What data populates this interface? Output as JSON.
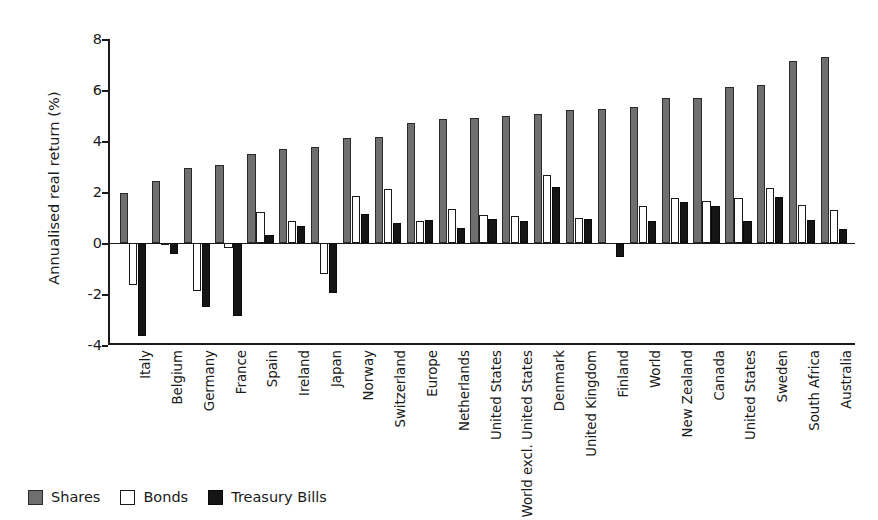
{
  "chart_data": {
    "type": "bar",
    "title": "",
    "xlabel": "",
    "ylabel": "Annualised real return (%)",
    "ylim": [
      -4,
      8
    ],
    "yticks": [
      -4,
      -2,
      0,
      2,
      4,
      6,
      8
    ],
    "ytick_labels": [
      "-4",
      "-2",
      "0",
      "2",
      "4",
      "6",
      "8"
    ],
    "grid": false,
    "legend_position": "bottom-left",
    "categories": [
      "Italy",
      "Belgium",
      "Germany",
      "France",
      "Spain",
      "Ireland",
      "Japan",
      "Norway",
      "Switzerland",
      "Europe",
      "Netherlands",
      "United States",
      "World excl. United States",
      "Denmark",
      "United Kingdom",
      "Finland",
      "World",
      "New Zealand",
      "Canada",
      "United States",
      "Sweden",
      "South Africa",
      "Australia"
    ],
    "series": [
      {
        "name": "Shares",
        "color": "#6f6f6f",
        "values": [
          1.95,
          2.45,
          2.95,
          3.05,
          3.5,
          3.7,
          3.75,
          4.1,
          4.15,
          4.7,
          4.85,
          4.9,
          5.0,
          5.05,
          5.2,
          5.25,
          5.35,
          5.7,
          5.7,
          6.1,
          6.2,
          7.15,
          7.3
        ]
      },
      {
        "name": "Bonds",
        "color": "#ffffff",
        "values": [
          -1.65,
          -0.05,
          -1.9,
          -0.2,
          1.2,
          0.85,
          -1.2,
          1.85,
          2.1,
          0.85,
          1.35,
          1.1,
          1.05,
          2.65,
          1.0,
          0.0,
          1.45,
          1.75,
          1.65,
          1.75,
          2.15,
          1.5,
          1.3
        ]
      },
      {
        "name": "Treasury Bills",
        "color": "#151515",
        "values": [
          -3.65,
          -0.45,
          -2.5,
          -2.85,
          0.3,
          0.65,
          -1.95,
          1.15,
          0.8,
          0.9,
          0.6,
          0.95,
          0.85,
          2.2,
          0.95,
          -0.55,
          0.85,
          1.6,
          1.45,
          0.85,
          1.8,
          0.9,
          0.55
        ]
      }
    ]
  },
  "legend": {
    "items": [
      {
        "label": "Shares",
        "swatch": "shares"
      },
      {
        "label": "Bonds",
        "swatch": "bonds"
      },
      {
        "label": "Treasury Bills",
        "swatch": "bills"
      }
    ]
  }
}
